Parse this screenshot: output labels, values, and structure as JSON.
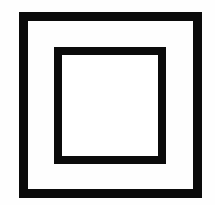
{
  "canvas": {
    "width": 215,
    "height": 205,
    "background_color": "#fefefe"
  },
  "symbol": {
    "name": "class-ii-double-insulation-symbol",
    "description": "Two concentric squares",
    "stroke_color": "#0b0b0b",
    "fill_color": "#ffffff",
    "outer_square": {
      "label": "outer square",
      "left": 19,
      "top": 12,
      "width": 183,
      "height": 186,
      "stroke_width": 9
    },
    "inner_square": {
      "label": "inner square",
      "left": 54,
      "top": 47,
      "width": 112,
      "height": 117,
      "stroke_width": 8
    },
    "inner_field": {
      "label": "blank interior",
      "left": 62,
      "top": 55,
      "width": 96,
      "height": 101
    }
  }
}
